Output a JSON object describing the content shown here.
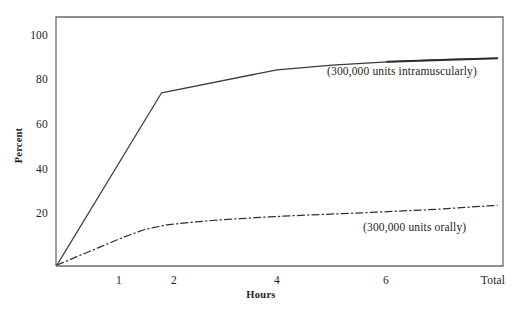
{
  "chart_data": {
    "type": "line",
    "title": "",
    "xlabel": "Hours",
    "ylabel": "Percent",
    "xlim": [
      0,
      8.05
    ],
    "ylim": [
      0,
      108
    ],
    "grid": false,
    "legend_position": "inline-annotation",
    "x_tick_values": [
      1,
      2,
      4,
      6,
      8
    ],
    "x_tick_labels": [
      "1",
      "2",
      "4",
      "6",
      "Total"
    ],
    "y_tick_values": [
      20,
      40,
      60,
      80,
      100
    ],
    "y_tick_labels": [
      "20",
      "40",
      "60",
      "80",
      "100"
    ],
    "series": [
      {
        "name": "(300,000 units intramuscularly)",
        "style": "solid",
        "x": [
          0,
          1.9,
          4.0,
          5.0,
          6.0,
          7.0,
          8.0
        ],
        "values": [
          0,
          75,
          85,
          87,
          88.5,
          89.5,
          90
        ]
      },
      {
        "name": "(300,000 units orally)",
        "style": "dash-dot",
        "x": [
          0,
          0.4,
          0.8,
          1.2,
          1.6,
          2.0,
          2.4,
          2.8,
          3.2,
          3.6,
          4.0,
          4.6,
          5.2,
          5.8,
          6.4,
          7.0,
          7.5,
          8.0
        ],
        "values": [
          0,
          4,
          8,
          12,
          15.5,
          17.5,
          18.5,
          19.4,
          20.0,
          20.6,
          21.1,
          21.8,
          22.4,
          23.0,
          23.7,
          24.4,
          25.2,
          26.0
        ]
      }
    ],
    "annotations": [
      {
        "text": "(300,000 units intramuscularly)",
        "x": 5.0,
        "y": 82
      },
      {
        "text": "(300,000 units orally)",
        "x": 5.7,
        "y": 18
      }
    ],
    "colors": {
      "axis": "#58595b",
      "line_intramuscular": "#3b3b3d",
      "line_oral": "#2f2f31",
      "text": "#231f20",
      "background": "#ffffff"
    }
  },
  "figure": {
    "axis_label_x": "Hours",
    "axis_label_y": "Percent",
    "label_intramuscular": "(300,000 units intramuscularly)",
    "label_oral": "(300,000 units orally)",
    "ytick_100": "100",
    "ytick_80": "80",
    "ytick_60": "60",
    "ytick_40": "40",
    "ytick_20": "20",
    "xtick_1": "1",
    "xtick_2": "2",
    "xtick_4": "4",
    "xtick_6": "6",
    "xtick_total": "Total",
    "caption_partial": ""
  }
}
